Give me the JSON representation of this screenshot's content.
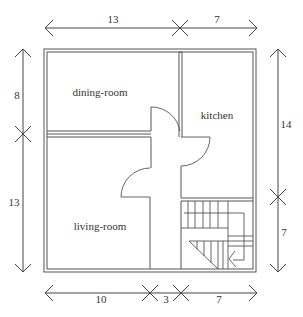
{
  "rooms": [
    {
      "id": "dining-room",
      "label": "dining-room"
    },
    {
      "id": "kitchen",
      "label": "kitchen"
    },
    {
      "id": "living-room",
      "label": "living-room"
    }
  ],
  "dimensions": {
    "top": [
      "13",
      "7"
    ],
    "bottom": [
      "10",
      "3",
      "7"
    ],
    "left": [
      "8",
      "13"
    ],
    "right": [
      "14",
      "7"
    ]
  }
}
